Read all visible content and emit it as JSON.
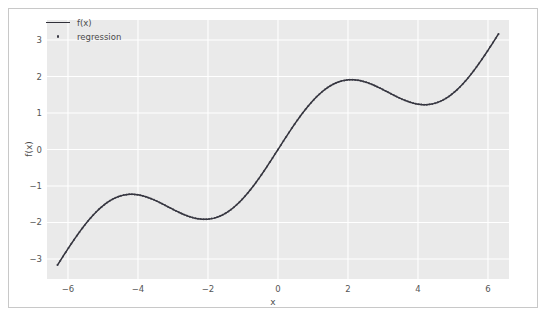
{
  "chart_data": {
    "type": "line",
    "title": "",
    "xlabel": "x",
    "ylabel": "f(x)",
    "xlim": [
      -6.6,
      6.6
    ],
    "ylim": [
      -3.55,
      3.55
    ],
    "xticks": [
      -6,
      -4,
      -2,
      0,
      2,
      4,
      6
    ],
    "xticklabels": [
      "−6",
      "−4",
      "−2",
      "0",
      "2",
      "4",
      "6"
    ],
    "yticks": [
      -3,
      -2,
      -1,
      0,
      1,
      2,
      3
    ],
    "yticklabels": [
      "−3",
      "−2",
      "−1",
      "0",
      "1",
      "2",
      "3"
    ],
    "grid": true,
    "grid_color": "#ffffff",
    "panel_color": "#eaeaea",
    "legend_position": "upper left",
    "formula": "f(x) = x/2 + sin(x)",
    "series": [
      {
        "name": "f(x)",
        "style": "line",
        "color": "#31313a",
        "linewidth": 1.5,
        "x": [
          -6.3,
          -6.1,
          -5.9,
          -5.7,
          -5.5,
          -5.3,
          -5.1,
          -4.9,
          -4.7,
          -4.5,
          -4.3,
          -4.1,
          -3.9,
          -3.7,
          -3.5,
          -3.3,
          -3.1,
          -2.9,
          -2.7,
          -2.5,
          -2.3,
          -2.1,
          -1.9,
          -1.7,
          -1.5,
          -1.3,
          -1.1,
          -0.9,
          -0.7,
          -0.5,
          -0.3,
          -0.1,
          0.1,
          0.3,
          0.5,
          0.7,
          0.9,
          1.1,
          1.3,
          1.5,
          1.7,
          1.9,
          2.1,
          2.3,
          2.5,
          2.7,
          2.9,
          3.1,
          3.3,
          3.5,
          3.7,
          3.9,
          4.1,
          4.3,
          4.5,
          4.7,
          4.9,
          5.1,
          5.3,
          5.5,
          5.7,
          5.9,
          6.1,
          6.3
        ],
        "y": [
          -3.13,
          -3.27,
          -3.32,
          -3.29,
          -3.18,
          -3.0,
          -2.78,
          -2.53,
          -2.31,
          -2.27,
          -2.23,
          -1.87,
          -1.26,
          -1.32,
          -1.4,
          -1.49,
          -1.59,
          -1.69,
          -1.78,
          -1.85,
          -1.89,
          -1.91,
          -1.9,
          -1.84,
          -1.75,
          -1.61,
          -1.44,
          -1.23,
          -0.99,
          -0.73,
          -0.45,
          -0.15,
          0.15,
          0.45,
          0.73,
          0.99,
          1.23,
          1.44,
          1.61,
          1.75,
          1.84,
          1.9,
          1.91,
          1.89,
          1.85,
          1.78,
          1.69,
          1.59,
          1.49,
          1.4,
          1.32,
          1.26,
          1.23,
          1.22,
          1.27,
          1.36,
          1.48,
          1.63,
          1.82,
          2.04,
          2.29,
          2.55,
          2.82,
          3.13
        ]
      },
      {
        "name": "regression",
        "style": "scatter",
        "color": "#3a3a45",
        "markersize": 2.6
      }
    ],
    "legend": [
      {
        "label": "f(x)",
        "marker": "line",
        "color": "#31313a"
      },
      {
        "label": "regression",
        "marker": "dot",
        "color": "#3a3a45"
      }
    ]
  }
}
